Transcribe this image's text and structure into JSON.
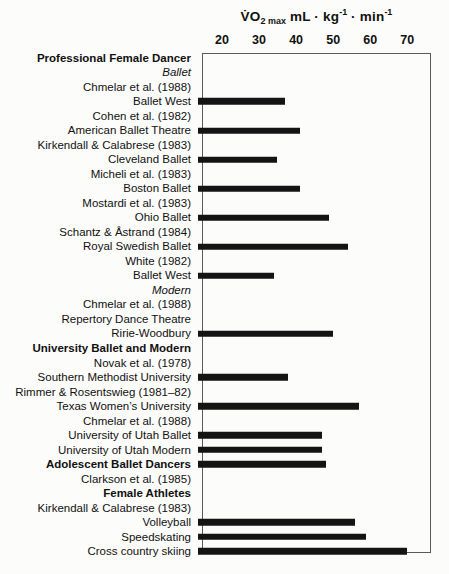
{
  "colors": {
    "bar": "#141414",
    "box_border": "#5a5a5a",
    "text": "#111111",
    "background": "#fcfcfa"
  },
  "chart_data": {
    "type": "bar",
    "orientation": "horizontal",
    "title_parts": {
      "vo": "V̇O",
      "sub": "2 max",
      "unit_a": " mL · kg",
      "sup_a": "-1",
      "unit_b": " · min",
      "sup_b": "-1"
    },
    "xlabel": "V̇O2max (mL per kg per min)",
    "xlim": [
      14.6,
      76.4
    ],
    "xticks": [
      20,
      30,
      40,
      50,
      60,
      70
    ],
    "grid": false,
    "legend": "none",
    "rows": [
      {
        "label": "Professional Female Dancer",
        "style": "bold",
        "value": null
      },
      {
        "label": "Ballet",
        "style": "italic",
        "value": null
      },
      {
        "label": "Chmelar et al. (1988)",
        "style": "normal",
        "value": null
      },
      {
        "label": "Ballet West",
        "style": "normal",
        "value": 38
      },
      {
        "label": "Cohen et al. (1982)",
        "style": "normal",
        "value": null
      },
      {
        "label": "American Ballet Theatre",
        "style": "normal",
        "value": 42
      },
      {
        "label": "Kirkendall & Calabrese (1983)",
        "style": "normal",
        "value": null
      },
      {
        "label": "Cleveland Ballet",
        "style": "normal",
        "value": 36
      },
      {
        "label": "Micheli et al. (1983)",
        "style": "normal",
        "value": null
      },
      {
        "label": "Boston Ballet",
        "style": "normal",
        "value": 42
      },
      {
        "label": "Mostardi et al. (1983)",
        "style": "normal",
        "value": null
      },
      {
        "label": "Ohio Ballet",
        "style": "normal",
        "value": 50
      },
      {
        "label": "Schantz & Åstrand (1984)",
        "style": "normal",
        "value": null
      },
      {
        "label": "Royal Swedish Ballet",
        "style": "normal",
        "value": 55
      },
      {
        "label": "White (1982)",
        "style": "normal",
        "value": null
      },
      {
        "label": "Ballet West",
        "style": "normal",
        "value": 35
      },
      {
        "label": "Modern",
        "style": "italic",
        "value": null
      },
      {
        "label": "Chmelar et al. (1988)",
        "style": "normal",
        "value": null
      },
      {
        "label": "Repertory Dance Theatre",
        "style": "normal",
        "value": null
      },
      {
        "label": "Ririe-Woodbury",
        "style": "normal",
        "value": 51
      },
      {
        "label": "University Ballet and Modern",
        "style": "bold",
        "value": null
      },
      {
        "label": "Novak et al. (1978)",
        "style": "normal",
        "value": null
      },
      {
        "label": "Southern Methodist University",
        "style": "normal",
        "value": 39
      },
      {
        "label": "Rimmer & Rosentswieg (1981–82)",
        "style": "normal",
        "value": null
      },
      {
        "label": "Texas Women’s University",
        "style": "normal",
        "value": 58
      },
      {
        "label": "Chmelar et al. (1988)",
        "style": "normal",
        "value": null
      },
      {
        "label": "University of Utah Ballet",
        "style": "normal",
        "value": 48
      },
      {
        "label": "University of Utah Modern",
        "style": "normal",
        "value": 48
      },
      {
        "label": "Adolescent Ballet Dancers",
        "style": "bold",
        "value": 49
      },
      {
        "label": "Clarkson et al. (1985)",
        "style": "normal",
        "value": null
      },
      {
        "label": "Female Athletes",
        "style": "bold",
        "value": null
      },
      {
        "label": "Kirkendall & Calabrese (1983)",
        "style": "normal",
        "value": null
      },
      {
        "label": "Volleyball",
        "style": "normal",
        "value": 57
      },
      {
        "label": "Speedskating",
        "style": "normal",
        "value": 60
      },
      {
        "label": "Cross country skiing",
        "style": "normal",
        "value": 71
      }
    ]
  }
}
